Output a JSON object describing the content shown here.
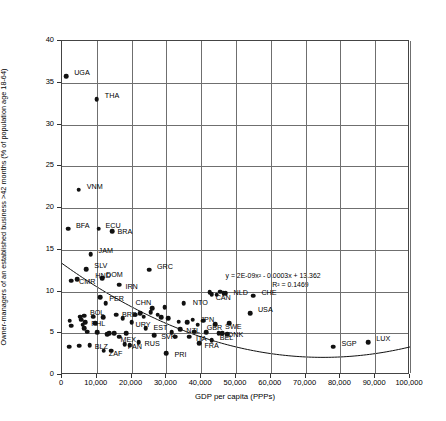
{
  "chart_data": {
    "type": "scatter",
    "title": "",
    "xlabel": "GDP per capita (PPPs)",
    "ylabel": "Owner-managers of an established business >42 months (% of population age 18-64)",
    "xlim": [
      0,
      100000
    ],
    "ylim": [
      0,
      40
    ],
    "xticks": [
      "0",
      "10,000",
      "20,000",
      "30,000",
      "40,000",
      "50,000",
      "60,000",
      "70,000",
      "80,000",
      "90,000",
      "100,000"
    ],
    "xtick_values": [
      0,
      10000,
      20000,
      30000,
      40000,
      50000,
      60000,
      70000,
      80000,
      90000,
      100000
    ],
    "yticks": [
      "0",
      "5",
      "10",
      "15",
      "20",
      "25",
      "30",
      "35",
      "40"
    ],
    "ytick_values": [
      0,
      5,
      10,
      15,
      20,
      25,
      30,
      35,
      40
    ],
    "grid": true,
    "legend": "none",
    "marker_color": "#111111",
    "trendline": {
      "type": "polynomial",
      "order": 2,
      "equation": "y = 2E-09x² - 0.0003x + 13.362",
      "r_squared_label": "R² = 0.1469",
      "r_squared": 0.1469,
      "coefficients": {
        "a": 2e-09,
        "b": -0.0003,
        "c": 13.362
      }
    },
    "points": [
      {
        "label": "UGA",
        "x": 1200,
        "y": 35.8,
        "lx": 8,
        "ly": -3
      },
      {
        "label": "THA",
        "x": 10000,
        "y": 33.0,
        "lx": 8,
        "ly": -3
      },
      {
        "label": "VNM",
        "x": 4800,
        "y": 22.2,
        "lx": 8,
        "ly": -3
      },
      {
        "label": "BFA",
        "x": 1700,
        "y": 17.5,
        "lx": 8,
        "ly": -3
      },
      {
        "label": "ECU",
        "x": 10500,
        "y": 17.5,
        "lx": 7,
        "ly": -3
      },
      {
        "label": "BRA",
        "x": 14500,
        "y": 17.2,
        "lx": 5,
        "ly": 1
      },
      {
        "label": "JAM",
        "x": 8200,
        "y": 14.5,
        "lx": 8,
        "ly": -3
      },
      {
        "label": "SLV",
        "x": 7000,
        "y": 12.7,
        "lx": 8,
        "ly": -3
      },
      {
        "label": "GRC",
        "x": 25000,
        "y": 12.6,
        "lx": 8,
        "ly": -3
      },
      {
        "label": "CMR",
        "x": 2600,
        "y": 11.3,
        "lx": 8,
        "ly": 1
      },
      {
        "label": "DOM",
        "x": 11500,
        "y": 11.6,
        "lx": 4,
        "ly": -3
      },
      {
        "label": "HND",
        "x": 4400,
        "y": 11.5,
        "lx": 18,
        "ly": -3
      },
      {
        "label": "IRN",
        "x": 16500,
        "y": 10.8,
        "lx": 6,
        "ly": 2
      },
      {
        "label": "PER",
        "x": 11000,
        "y": 9.3,
        "lx": 9,
        "ly": 2
      },
      {
        "label": "CHN",
        "x": 12500,
        "y": 8.6,
        "lx": 30,
        "ly": 0
      },
      {
        "label": "NTO",
        "x": 35000,
        "y": 8.6,
        "lx": 9,
        "ly": 0
      },
      {
        "label": "NLD",
        "x": 47000,
        "y": 9.8,
        "lx": 8,
        "ly": 0
      },
      {
        "label": "CAN",
        "x": 43000,
        "y": 9.7,
        "lx": 4,
        "ly": 4
      },
      {
        "label": "CHE",
        "x": 55000,
        "y": 9.5,
        "lx": 8,
        "ly": -3
      },
      {
        "label": "USA",
        "x": 54000,
        "y": 7.4,
        "lx": 8,
        "ly": -3
      },
      {
        "label": "BOL",
        "x": 6300,
        "y": 7.1,
        "lx": 6,
        "ly": -3
      },
      {
        "label": "PHL",
        "x": 6700,
        "y": 6.3,
        "lx": 6,
        "ly": 2
      },
      {
        "label": "BRB",
        "x": 15500,
        "y": 7.2,
        "lx": 6,
        "ly": 0
      },
      {
        "label": "URY",
        "x": 20000,
        "y": 6.3,
        "lx": 4,
        "ly": 3
      },
      {
        "label": "JPN",
        "x": 37500,
        "y": 6.6,
        "lx": 8,
        "ly": 0
      },
      {
        "label": "GBR",
        "x": 39000,
        "y": 6.0,
        "lx": 9,
        "ly": 3
      },
      {
        "label": "SWE",
        "x": 44000,
        "y": 6.1,
        "lx": 10,
        "ly": 3
      },
      {
        "label": "EST",
        "x": 24000,
        "y": 5.6,
        "lx": 8,
        "ly": 0
      },
      {
        "label": "NZL",
        "x": 34000,
        "y": 5.5,
        "lx": 6,
        "ly": 2
      },
      {
        "label": "SVK",
        "x": 26500,
        "y": 4.8,
        "lx": 7,
        "ly": 2
      },
      {
        "label": "ITA",
        "x": 36500,
        "y": 4.6,
        "lx": 7,
        "ly": 2
      },
      {
        "label": "DNK",
        "x": 46000,
        "y": 5.0,
        "lx": 6,
        "ly": 2
      },
      {
        "label": "BEL",
        "x": 43000,
        "y": 4.2,
        "lx": 8,
        "ly": -2
      },
      {
        "label": "FRA",
        "x": 39500,
        "y": 3.8,
        "lx": 5,
        "ly": 3
      },
      {
        "label": "MEX",
        "x": 16500,
        "y": 4.6,
        "lx": 1,
        "ly": 3
      },
      {
        "label": "RUS",
        "x": 22000,
        "y": 3.9,
        "lx": 6,
        "ly": 2
      },
      {
        "label": "PAN",
        "x": 18000,
        "y": 3.7,
        "lx": 3,
        "ly": 3
      },
      {
        "label": "BLZ",
        "x": 8000,
        "y": 3.6,
        "lx": 5,
        "ly": 2
      },
      {
        "label": "ZAF",
        "x": 12000,
        "y": 2.9,
        "lx": 5,
        "ly": 3
      },
      {
        "label": "PRI",
        "x": 30000,
        "y": 2.6,
        "lx": 8,
        "ly": 2
      },
      {
        "label": "SGP",
        "x": 78000,
        "y": 3.4,
        "lx": 8,
        "ly": -3
      },
      {
        "label": "LUX",
        "x": 88000,
        "y": 3.9,
        "lx": 8,
        "ly": -3
      },
      {
        "label": "",
        "x": 2200,
        "y": 6.5,
        "lx": 0,
        "ly": 0
      },
      {
        "label": "",
        "x": 2600,
        "y": 5.9,
        "lx": 0,
        "ly": 0
      },
      {
        "label": "",
        "x": 2000,
        "y": 3.4,
        "lx": 0,
        "ly": 0
      },
      {
        "label": "",
        "x": 5000,
        "y": 3.5,
        "lx": 0,
        "ly": 0
      },
      {
        "label": "",
        "x": 5200,
        "y": 7.0,
        "lx": 0,
        "ly": 0
      },
      {
        "label": "",
        "x": 5600,
        "y": 6.6,
        "lx": 0,
        "ly": 0
      },
      {
        "label": "",
        "x": 6000,
        "y": 6.0,
        "lx": 0,
        "ly": 0
      },
      {
        "label": "",
        "x": 6400,
        "y": 5.6,
        "lx": 0,
        "ly": 0
      },
      {
        "label": "",
        "x": 7200,
        "y": 5.2,
        "lx": 0,
        "ly": 0
      },
      {
        "label": "",
        "x": 9000,
        "y": 7.0,
        "lx": 0,
        "ly": 0
      },
      {
        "label": "",
        "x": 9600,
        "y": 6.2,
        "lx": 0,
        "ly": 0
      },
      {
        "label": "",
        "x": 10200,
        "y": 5.1,
        "lx": 0,
        "ly": 0
      },
      {
        "label": "",
        "x": 11800,
        "y": 6.9,
        "lx": 0,
        "ly": 0
      },
      {
        "label": "",
        "x": 13000,
        "y": 4.9,
        "lx": 0,
        "ly": 0
      },
      {
        "label": "",
        "x": 13600,
        "y": 5.0,
        "lx": 0,
        "ly": 0
      },
      {
        "label": "",
        "x": 14200,
        "y": 2.9,
        "lx": 0,
        "ly": 0
      },
      {
        "label": "",
        "x": 15000,
        "y": 5.0,
        "lx": 0,
        "ly": 0
      },
      {
        "label": "",
        "x": 17500,
        "y": 6.8,
        "lx": 0,
        "ly": 0
      },
      {
        "label": "",
        "x": 18500,
        "y": 5.0,
        "lx": 0,
        "ly": 0
      },
      {
        "label": "",
        "x": 19500,
        "y": 3.6,
        "lx": 0,
        "ly": 0
      },
      {
        "label": "",
        "x": 21000,
        "y": 7.2,
        "lx": 0,
        "ly": 0
      },
      {
        "label": "",
        "x": 22500,
        "y": 7.4,
        "lx": 0,
        "ly": 0
      },
      {
        "label": "",
        "x": 23500,
        "y": 7.0,
        "lx": 0,
        "ly": 0
      },
      {
        "label": "",
        "x": 25500,
        "y": 7.5,
        "lx": 0,
        "ly": 0
      },
      {
        "label": "",
        "x": 26000,
        "y": 8.0,
        "lx": 0,
        "ly": 0
      },
      {
        "label": "",
        "x": 27500,
        "y": 7.2,
        "lx": 0,
        "ly": 0
      },
      {
        "label": "",
        "x": 28500,
        "y": 6.9,
        "lx": 0,
        "ly": 0
      },
      {
        "label": "",
        "x": 29500,
        "y": 8.1,
        "lx": 0,
        "ly": 0
      },
      {
        "label": "",
        "x": 30500,
        "y": 6.8,
        "lx": 0,
        "ly": 0
      },
      {
        "label": "",
        "x": 31500,
        "y": 5.1,
        "lx": 0,
        "ly": 0
      },
      {
        "label": "",
        "x": 32500,
        "y": 4.6,
        "lx": 0,
        "ly": 0
      },
      {
        "label": "",
        "x": 33500,
        "y": 6.4,
        "lx": 0,
        "ly": 0
      },
      {
        "label": "",
        "x": 36000,
        "y": 6.3,
        "lx": 0,
        "ly": 0
      },
      {
        "label": "",
        "x": 38000,
        "y": 5.2,
        "lx": 0,
        "ly": 0
      },
      {
        "label": "",
        "x": 40500,
        "y": 6.5,
        "lx": 0,
        "ly": 0
      },
      {
        "label": "",
        "x": 41500,
        "y": 5.1,
        "lx": 0,
        "ly": 0
      },
      {
        "label": "",
        "x": 42500,
        "y": 9.9,
        "lx": 0,
        "ly": 0
      },
      {
        "label": "",
        "x": 44500,
        "y": 9.6,
        "lx": 0,
        "ly": 0
      },
      {
        "label": "",
        "x": 45500,
        "y": 10.0,
        "lx": 0,
        "ly": 0
      },
      {
        "label": "",
        "x": 46500,
        "y": 9.8,
        "lx": 0,
        "ly": 0
      },
      {
        "label": "",
        "x": 48000,
        "y": 6.2,
        "lx": 0,
        "ly": 0
      },
      {
        "label": "",
        "x": 45000,
        "y": 5.0,
        "lx": 0,
        "ly": 0
      },
      {
        "label": "",
        "x": 47500,
        "y": 4.9,
        "lx": 0,
        "ly": 0
      }
    ]
  }
}
